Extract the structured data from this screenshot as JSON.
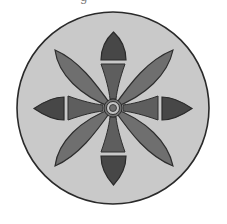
{
  "caption_fragment": "g",
  "emblem": {
    "description": "circular rosette medallion with four leaf petals and four arrow-tipped stems",
    "colors": {
      "background": "#ffffff",
      "disc_fill": "#c9c9c9",
      "disc_stroke": "#2a2a2a",
      "petal_fill": "#6f6f6f",
      "stem_fill": "#5e5e5e",
      "arrowhead_fill": "#474747",
      "outline": "#2e2e2e",
      "ring_fill": "#c4c4c4"
    },
    "center": [
      113,
      108
    ],
    "radius": 96,
    "petal_count": 4,
    "arrow_count": 4
  }
}
